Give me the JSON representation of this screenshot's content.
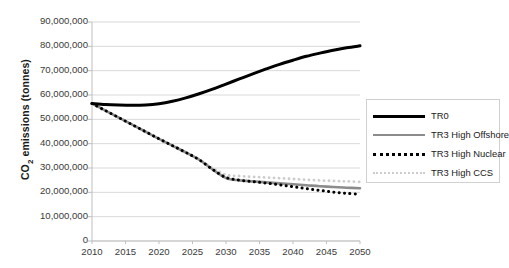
{
  "chart_data": {
    "type": "line",
    "title": "",
    "xlabel": "",
    "ylabel": "CO2 emissions (tonnes)",
    "ylabel_base": "CO",
    "ylabel_sub": "2",
    "ylabel_rest": " emissions (tonnes)",
    "xlim": [
      2010,
      2050
    ],
    "ylim": [
      0,
      90000000
    ],
    "grid": true,
    "legend_position": "right",
    "x_ticks": [
      "2010",
      "2015",
      "2020",
      "2025",
      "2030",
      "2035",
      "2040",
      "2045",
      "2050"
    ],
    "x_tick_values": [
      2010,
      2015,
      2020,
      2025,
      2030,
      2035,
      2040,
      2045,
      2050
    ],
    "y_ticks": [
      "0",
      "10,000,000",
      "20,000,000",
      "30,000,000",
      "40,000,000",
      "50,000,000",
      "60,000,000",
      "70,000,000",
      "80,000,000",
      "90,000,000"
    ],
    "y_tick_values": [
      0,
      10000000,
      20000000,
      30000000,
      40000000,
      50000000,
      60000000,
      70000000,
      80000000,
      90000000
    ],
    "x": [
      2010,
      2012,
      2014,
      2016,
      2018,
      2020,
      2022,
      2024,
      2026,
      2028,
      2030,
      2032,
      2034,
      2036,
      2038,
      2040,
      2042,
      2044,
      2046,
      2048,
      2050
    ],
    "series": [
      {
        "name": "TR0",
        "color": "#000000",
        "style": "solid",
        "width": 3.0,
        "values": [
          56500000,
          56100000,
          55900000,
          55800000,
          55900000,
          56400000,
          57400000,
          58800000,
          60500000,
          62400000,
          64500000,
          66600000,
          68700000,
          70700000,
          72600000,
          74300000,
          75900000,
          77200000,
          78400000,
          79400000,
          80200000
        ]
      },
      {
        "name": "TR3 High Offshore",
        "color": "#8c8c8c",
        "style": "solid",
        "width": 2.6,
        "values": [
          56500000,
          53600000,
          50700000,
          47800000,
          44900000,
          42000000,
          39200000,
          36400000,
          33400000,
          29400000,
          25900000,
          24900000,
          24500000,
          24100000,
          23700000,
          23300000,
          22900000,
          22500000,
          22200000,
          21900000,
          21700000
        ]
      },
      {
        "name": "TR3 High Nuclear",
        "color": "#000000",
        "style": "dotted",
        "width": 3.0,
        "values": [
          56500000,
          53600000,
          50700000,
          47800000,
          44900000,
          42000000,
          39200000,
          36400000,
          33400000,
          29400000,
          26100000,
          25000000,
          24400000,
          23800000,
          23100000,
          22300000,
          21500000,
          20800000,
          20100000,
          19600000,
          19200000
        ]
      },
      {
        "name": "TR3 High CCS",
        "color": "#cccccc",
        "style": "dotted",
        "width": 2.8,
        "values": [
          56500000,
          53600000,
          50700000,
          47800000,
          44900000,
          42000000,
          39200000,
          36400000,
          33500000,
          30000000,
          27200000,
          26700000,
          26400000,
          26100000,
          25800000,
          25500000,
          25200000,
          24900000,
          24700000,
          24500000,
          24300000
        ]
      }
    ],
    "legend_entries": [
      {
        "label": "TR0",
        "swatch": "solid-black"
      },
      {
        "label": "TR3 High Offshore",
        "swatch": "solid-gray"
      },
      {
        "label": "TR3 High Nuclear",
        "swatch": "dotted-black"
      },
      {
        "label": "TR3 High CCS",
        "swatch": "dotted-lightgray"
      }
    ],
    "colors": {
      "tr0": "#000000",
      "tr3_high_offshore": "#8c8c8c",
      "tr3_high_nuclear": "#000000",
      "tr3_high_ccs": "#cccccc",
      "grid": "#d9d9d9",
      "axis": "#bfbfbf",
      "text": "#3a3a3a",
      "background": "#ffffff"
    }
  }
}
